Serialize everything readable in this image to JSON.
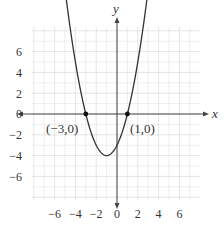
{
  "chart_data": {
    "type": "line",
    "title": "",
    "function": "y = (x + 3)(x - 1)",
    "xlabel": "x",
    "ylabel": "y",
    "xlim": [
      -8,
      8
    ],
    "ylim": [
      -8,
      8
    ],
    "grid": true,
    "x_ticks": [
      -6,
      -4,
      -2,
      0,
      2,
      4,
      6
    ],
    "y_ticks": [
      6,
      4,
      2,
      0,
      -2,
      -4,
      -6
    ],
    "x_tick_labels": [
      "−6",
      "−4",
      "−2",
      "0",
      "2",
      "4",
      "6"
    ],
    "y_tick_labels": [
      "6",
      "4",
      "2",
      "0",
      "−2",
      "−4",
      "−6"
    ],
    "series": [
      {
        "name": "parabola",
        "x": [
          -5.3,
          -5,
          -4,
          -3,
          -2,
          -1,
          0,
          1,
          2,
          3,
          3.3
        ],
        "y": [
          7.29,
          5,
          0,
          0,
          -3,
          -4,
          -3,
          0,
          5,
          12,
          7.29
        ]
      }
    ],
    "vertex": {
      "x": -1,
      "y": -4
    },
    "annotations": [
      {
        "text": "(−3,0)",
        "x": -3,
        "y": 0
      },
      {
        "text": "(1,0)",
        "x": 1,
        "y": 0
      }
    ]
  },
  "labels": {
    "x_axis": "x",
    "y_axis": "y",
    "point_left": "(−3,0)",
    "point_right": "(1,0)",
    "xt0": "−6",
    "xt1": "−4",
    "xt2": "−2",
    "xt3": "0",
    "xt4": "2",
    "xt5": "4",
    "xt6": "6",
    "yt0": "6",
    "yt1": "4",
    "yt2": "2",
    "yt3": "0",
    "yt4": "−2",
    "yt5": "−4",
    "yt6": "−6"
  },
  "colors": {
    "curve": "#333333",
    "grid": "#dddddd",
    "axis": "#444444"
  }
}
